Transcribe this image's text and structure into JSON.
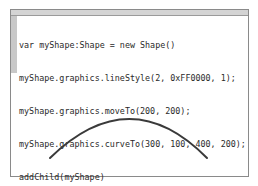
{
  "editor": {
    "code_lines": [
      "var myShape:Shape = new Shape()",
      "myShape.graphics.lineStyle(2, 0xFF0000, 1);",
      "myShape.graphics.moveTo(200, 200);",
      "myShape.graphics.curveTo(300, 100, 400, 200);",
      "addChild(myShape)"
    ]
  },
  "stage": {
    "curve": {
      "start": [
        50,
        158
      ],
      "control": [
        130,
        80
      ],
      "end": [
        207,
        158
      ],
      "stroke": "#3a3a3a",
      "width": 2
    }
  }
}
